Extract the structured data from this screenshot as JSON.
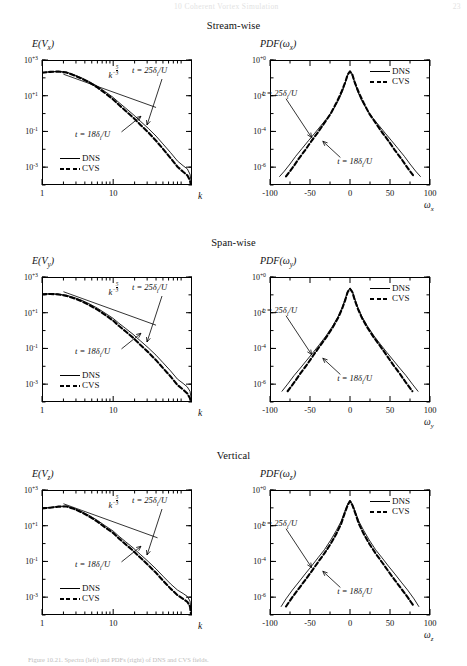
{
  "running_head": {
    "text": "Coherent Vortex Simulation",
    "chapter_no": "10",
    "folio": "23"
  },
  "figure": {
    "caption": "Figure 10.21. Spectra (left) and PDFs (right) of DNS and CVS fields."
  },
  "sections": [
    {
      "id": "stream-wise",
      "title": "Stream-wise"
    },
    {
      "id": "span-wise",
      "title": "Span-wise"
    },
    {
      "id": "vertical",
      "title": "Vertical"
    }
  ],
  "legend": {
    "dns_label": "DNS",
    "cvs_label": "CVS",
    "dns_style": "solid-thin",
    "cvs_style": "dashed-thick"
  },
  "annotations": {
    "slope_label": "k",
    "slope_exponent_num": "5",
    "slope_exponent_den": "3",
    "t25": "t = 25δ",
    "t25_sub": "i",
    "t25_tail": "/U",
    "t18": "t = 18δ",
    "t18_sub": "i",
    "t18_tail": "/U"
  },
  "colors": {
    "ink": "#000000",
    "paper": "#ffffff",
    "faint": "#e2e2e2"
  },
  "chart_data": [
    {
      "id": "spectrum-vx",
      "type": "line",
      "title": "E(V_x)",
      "title_main": "E(V",
      "title_sub": "x",
      "title_close": ")",
      "xlabel": "k",
      "ylabel": "E(V_x)",
      "xscale": "log",
      "yscale": "log",
      "xlim": [
        1,
        128
      ],
      "ylim": [
        0.0001,
        1000.0
      ],
      "xticks": [
        1,
        10
      ],
      "xtick_labels": [
        "1",
        "10"
      ],
      "yticks": [
        1000.0,
        10.0,
        0.1,
        0.001
      ],
      "ytick_labels": [
        "10+3",
        "10+1",
        "10-1",
        "10-3"
      ],
      "grid": false,
      "reference_slope": {
        "label": "k^-5/3",
        "exponent": -1.6667,
        "x": [
          2,
          40
        ],
        "y": [
          160,
          2.2
        ]
      },
      "series": [
        {
          "name": "DNS",
          "style": "solid-thin",
          "x": [
            1,
            1.3,
            1.7,
            2.2,
            2.8,
            3.6,
            4.6,
            6,
            7.7,
            10,
            12,
            15,
            19,
            24,
            31,
            40,
            50,
            64,
            80,
            96,
            110,
            120,
            126
          ],
          "y": [
            200,
            220,
            230,
            210,
            150,
            100,
            62,
            34,
            17,
            8,
            4.2,
            2.0,
            0.9,
            0.38,
            0.15,
            0.055,
            0.02,
            0.0065,
            0.0022,
            0.0012,
            0.0008,
            0.0004,
            0.00012
          ]
        },
        {
          "name": "CVS",
          "style": "dashed-thick",
          "x": [
            1,
            1.3,
            1.7,
            2.2,
            2.8,
            3.6,
            4.6,
            6,
            7.7,
            10,
            12,
            15,
            19,
            24,
            31,
            40,
            50,
            64,
            80,
            96,
            110,
            120,
            126
          ],
          "y": [
            195,
            215,
            225,
            200,
            140,
            92,
            55,
            29,
            14,
            6.2,
            3.1,
            1.4,
            0.6,
            0.24,
            0.09,
            0.03,
            0.0105,
            0.0032,
            0.00105,
            0.00055,
            0.00035,
            0.00018,
            6e-05
          ]
        }
      ]
    },
    {
      "id": "pdf-wx",
      "type": "line",
      "title": "PDF(ω_x)",
      "title_main": "PDF(ω",
      "title_sub": "x",
      "title_close": ")",
      "xlabel": "ω_x",
      "xlabel_main": "ω",
      "xlabel_sub": "x",
      "ylabel": "PDF(ω_x)",
      "xscale": "linear",
      "yscale": "log",
      "xlim": [
        -100,
        100
      ],
      "ylim": [
        1e-07,
        1.0
      ],
      "xticks": [
        -100,
        -50,
        0,
        50,
        100
      ],
      "xtick_labels": [
        "-100",
        "-50",
        "0",
        "50",
        "100"
      ],
      "yticks": [
        1.0,
        0.01,
        0.0001,
        1e-06
      ],
      "ytick_labels": [
        "10+0",
        "10-2",
        "10-4",
        "10-6"
      ],
      "grid": false,
      "series": [
        {
          "name": "DNS",
          "style": "solid-thin",
          "x": [
            -88,
            -82,
            -75,
            -68,
            -60,
            -52,
            -44,
            -36,
            -28,
            -20,
            -14,
            -9,
            -5,
            -2,
            0,
            2,
            5,
            9,
            14,
            20,
            28,
            36,
            44,
            52,
            60,
            68,
            75,
            82,
            88
          ],
          "y": [
            3e-07,
            6e-07,
            1.5e-06,
            4e-06,
            1.1e-05,
            3e-05,
            8e-05,
            0.00022,
            0.0006,
            0.002,
            0.006,
            0.02,
            0.07,
            0.18,
            0.24,
            0.18,
            0.07,
            0.02,
            0.006,
            0.002,
            0.0006,
            0.00022,
            8e-05,
            3e-05,
            1.1e-05,
            4e-06,
            1.5e-06,
            6e-07,
            3e-07
          ]
        },
        {
          "name": "CVS",
          "style": "dashed-thick",
          "x": [
            -80,
            -72,
            -64,
            -56,
            -48,
            -40,
            -32,
            -24,
            -17,
            -11,
            -6,
            -3,
            0,
            3,
            6,
            11,
            17,
            24,
            32,
            40,
            48,
            56,
            64,
            72,
            80
          ],
          "y": [
            3e-07,
            9e-07,
            3e-06,
            9e-06,
            3e-05,
            9e-05,
            0.0003,
            0.001,
            0.004,
            0.015,
            0.055,
            0.15,
            0.23,
            0.15,
            0.055,
            0.015,
            0.004,
            0.001,
            0.0003,
            9e-05,
            3e-05,
            9e-06,
            3e-06,
            9e-07,
            3e-07
          ]
        }
      ]
    },
    {
      "id": "spectrum-vy",
      "type": "line",
      "title": "E(V_y)",
      "title_main": "E(V",
      "title_sub": "y",
      "title_close": ")",
      "xlabel": "k",
      "ylabel": "E(V_y)",
      "xscale": "log",
      "yscale": "log",
      "xlim": [
        1,
        128
      ],
      "ylim": [
        0.0001,
        1000.0
      ],
      "xticks": [
        1,
        10
      ],
      "xtick_labels": [
        "1",
        "10"
      ],
      "yticks": [
        1000.0,
        10.0,
        0.1,
        0.001
      ],
      "ytick_labels": [
        "10+3",
        "10+1",
        "10-1",
        "10-3"
      ],
      "grid": false,
      "reference_slope": {
        "label": "k^-5/3",
        "exponent": -1.6667,
        "x": [
          2,
          40
        ],
        "y": [
          150,
          2.0
        ]
      },
      "series": [
        {
          "name": "DNS",
          "style": "solid-thin",
          "x": [
            1,
            1.3,
            1.7,
            2.2,
            2.8,
            3.6,
            4.6,
            6,
            7.7,
            10,
            12,
            15,
            19,
            24,
            31,
            40,
            50,
            64,
            80,
            96,
            110,
            120,
            126
          ],
          "y": [
            110,
            115,
            110,
            95,
            72,
            50,
            32,
            18,
            9.5,
            4.8,
            2.6,
            1.3,
            0.62,
            0.27,
            0.11,
            0.042,
            0.016,
            0.0055,
            0.0019,
            0.0011,
            0.0007,
            0.0004,
            0.00013
          ]
        },
        {
          "name": "CVS",
          "style": "dashed-thick",
          "x": [
            1,
            1.3,
            1.7,
            2.2,
            2.8,
            3.6,
            4.6,
            6,
            7.7,
            10,
            12,
            15,
            19,
            24,
            31,
            40,
            50,
            64,
            80,
            96,
            110,
            120,
            126
          ],
          "y": [
            108,
            112,
            106,
            88,
            65,
            44,
            27,
            15,
            7.6,
            3.6,
            1.85,
            0.88,
            0.4,
            0.16,
            0.062,
            0.022,
            0.008,
            0.0027,
            0.0009,
            0.0005,
            0.0003,
            0.00016,
            6e-05
          ]
        }
      ]
    },
    {
      "id": "pdf-wy",
      "type": "line",
      "title": "PDF(ω_y)",
      "title_main": "PDF(ω",
      "title_sub": "y",
      "title_close": ")",
      "xlabel": "ω_y",
      "xlabel_main": "ω",
      "xlabel_sub": "y",
      "ylabel": "PDF(ω_y)",
      "xscale": "linear",
      "yscale": "log",
      "xlim": [
        -100,
        100
      ],
      "ylim": [
        1e-07,
        1.0
      ],
      "xticks": [
        -100,
        -50,
        0,
        50,
        100
      ],
      "xtick_labels": [
        "-100",
        "-50",
        "0",
        "50",
        "100"
      ],
      "yticks": [
        1.0,
        0.01,
        0.0001,
        1e-06
      ],
      "ytick_labels": [
        "10+0",
        "10-2",
        "10-4",
        "10-6"
      ],
      "grid": false,
      "series": [
        {
          "name": "DNS",
          "style": "solid-thin",
          "x": [
            -85,
            -78,
            -70,
            -62,
            -54,
            -46,
            -38,
            -30,
            -22,
            -15,
            -10,
            -6,
            -3,
            0,
            3,
            6,
            10,
            15,
            22,
            30,
            38,
            46,
            54,
            62,
            70,
            78,
            85
          ],
          "y": [
            4e-07,
            1e-06,
            3e-06,
            8e-06,
            2.2e-05,
            6e-05,
            0.00017,
            0.0005,
            0.0017,
            0.006,
            0.019,
            0.06,
            0.16,
            0.24,
            0.16,
            0.06,
            0.019,
            0.006,
            0.0017,
            0.0005,
            0.00017,
            6e-05,
            2.2e-05,
            8e-06,
            3e-06,
            1e-06,
            4e-07
          ]
        },
        {
          "name": "CVS",
          "style": "dashed-thick",
          "x": [
            -78,
            -70,
            -62,
            -54,
            -46,
            -38,
            -30,
            -22,
            -15,
            -10,
            -6,
            -3,
            0,
            3,
            6,
            10,
            15,
            22,
            30,
            38,
            46,
            54,
            62,
            70,
            78
          ],
          "y": [
            4e-07,
            1.2e-06,
            4e-06,
            1.2e-05,
            4e-05,
            0.00013,
            0.0004,
            0.0014,
            0.005,
            0.016,
            0.05,
            0.14,
            0.22,
            0.14,
            0.05,
            0.016,
            0.005,
            0.0014,
            0.0004,
            0.00013,
            4e-05,
            1.2e-05,
            4e-06,
            1.2e-06,
            4e-07
          ]
        }
      ]
    },
    {
      "id": "spectrum-vz",
      "type": "line",
      "title": "E(V_z)",
      "title_main": "E(V",
      "title_sub": "z",
      "title_close": ")",
      "xlabel": "k",
      "ylabel": "E(V_z)",
      "xscale": "log",
      "yscale": "log",
      "xlim": [
        1,
        128
      ],
      "ylim": [
        0.0001,
        1000.0
      ],
      "xticks": [
        1,
        10
      ],
      "xtick_labels": [
        "1",
        "10"
      ],
      "yticks": [
        1000.0,
        10.0,
        0.1,
        0.001
      ],
      "ytick_labels": [
        "10+3",
        "10+1",
        "10-1",
        "10-3"
      ],
      "grid": false,
      "reference_slope": {
        "label": "k^-5/3",
        "exponent": -1.6667,
        "x": [
          2,
          42
        ],
        "y": [
          170,
          2.1
        ]
      },
      "series": [
        {
          "name": "DNS",
          "style": "solid-thin",
          "x": [
            1,
            1.3,
            1.7,
            2.2,
            2.8,
            3.6,
            4.6,
            6,
            7.7,
            10,
            12,
            15,
            19,
            24,
            31,
            40,
            50,
            64,
            80,
            96,
            110,
            120,
            126
          ],
          "y": [
            95,
            105,
            120,
            125,
            95,
            62,
            38,
            20,
            10,
            5,
            2.6,
            1.25,
            0.58,
            0.25,
            0.1,
            0.038,
            0.015,
            0.0055,
            0.0025,
            0.0016,
            0.0011,
            0.0006,
            0.00013
          ]
        },
        {
          "name": "CVS",
          "style": "dashed-thick",
          "x": [
            1,
            1.3,
            1.7,
            2.2,
            2.8,
            3.6,
            4.6,
            6,
            7.7,
            10,
            12,
            15,
            19,
            24,
            31,
            40,
            50,
            64,
            80,
            96,
            110,
            120,
            126
          ],
          "y": [
            93,
            102,
            117,
            120,
            88,
            56,
            33,
            17,
            8,
            3.9,
            1.95,
            0.9,
            0.4,
            0.165,
            0.063,
            0.023,
            0.0085,
            0.003,
            0.0013,
            0.0008,
            0.00055,
            0.0003,
            6e-05
          ]
        }
      ]
    },
    {
      "id": "pdf-wz",
      "type": "line",
      "title": "PDF(ω_z)",
      "title_main": "PDF(ω",
      "title_sub": "z",
      "title_close": ")",
      "xlabel": "ω_z",
      "xlabel_main": "ω",
      "xlabel_sub": "z",
      "ylabel": "PDF(ω_z)",
      "xscale": "linear",
      "yscale": "log",
      "xlim": [
        -100,
        100
      ],
      "ylim": [
        1e-07,
        1.0
      ],
      "xticks": [
        -100,
        -50,
        0,
        50,
        100
      ],
      "xtick_labels": [
        "-100",
        "-50",
        "0",
        "50",
        "100"
      ],
      "yticks": [
        1.0,
        0.01,
        0.0001,
        1e-06
      ],
      "ytick_labels": [
        "10+0",
        "10-2",
        "10-4",
        "10-6"
      ],
      "grid": false,
      "series": [
        {
          "name": "DNS",
          "style": "solid-thin",
          "x": [
            -86,
            -80,
            -72,
            -64,
            -56,
            -48,
            -40,
            -32,
            -24,
            -17,
            -11,
            -7,
            -3,
            0,
            3,
            7,
            11,
            17,
            24,
            32,
            40,
            48,
            56,
            64,
            72,
            80,
            86
          ],
          "y": [
            3e-07,
            8e-07,
            2.5e-06,
            7e-06,
            2e-05,
            5.5e-05,
            0.00016,
            0.00045,
            0.0016,
            0.0055,
            0.018,
            0.055,
            0.16,
            0.26,
            0.16,
            0.055,
            0.018,
            0.0055,
            0.0016,
            0.00045,
            0.00016,
            5.5e-05,
            2e-05,
            7e-06,
            2.5e-06,
            8e-07,
            3e-07
          ]
        },
        {
          "name": "CVS",
          "style": "dashed-thick",
          "x": [
            -80,
            -72,
            -64,
            -56,
            -48,
            -40,
            -32,
            -24,
            -17,
            -11,
            -7,
            -3,
            0,
            3,
            7,
            11,
            17,
            24,
            32,
            40,
            48,
            56,
            64,
            72,
            80
          ],
          "y": [
            3e-07,
            1e-06,
            3e-06,
            9e-06,
            2.8e-05,
            9e-05,
            0.00028,
            0.001,
            0.0036,
            0.013,
            0.045,
            0.14,
            0.24,
            0.14,
            0.045,
            0.013,
            0.0036,
            0.001,
            0.00028,
            9e-05,
            2.8e-05,
            9e-06,
            3e-06,
            1e-06,
            3e-07
          ]
        }
      ]
    }
  ]
}
